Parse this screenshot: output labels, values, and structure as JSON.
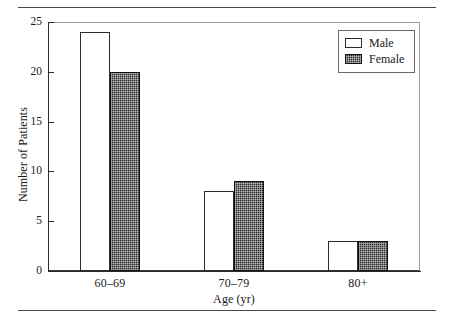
{
  "chart_data": {
    "type": "bar",
    "title": "",
    "xlabel": "Age (yr)",
    "ylabel": "Number of Patients",
    "categories": [
      "60–69",
      "70–79",
      "80+"
    ],
    "series": [
      {
        "name": "Male",
        "values": [
          24,
          8,
          3
        ]
      },
      {
        "name": "Female",
        "values": [
          20,
          9,
          3
        ]
      }
    ],
    "ylim": [
      0,
      25
    ],
    "yticks": [
      0,
      5,
      10,
      15,
      20,
      25
    ],
    "ytick_labels": [
      "0",
      "5",
      "10",
      "15",
      "20",
      "25"
    ],
    "grid": false,
    "legend_position": "top-right",
    "colors": {
      "male_fill": "#ffffff",
      "male_edge": "#2b2b2b",
      "female_fill": "#2a2a2a",
      "female_edge": "#111111",
      "axis": "#2b2b2b",
      "frame": "#9a9a9a",
      "rule": "#4a4a4a",
      "background": "#ffffff",
      "text": "#1a1a1a"
    }
  },
  "legend": {
    "entries": [
      {
        "label": "Male"
      },
      {
        "label": "Female"
      }
    ]
  },
  "axes": {
    "y_title": "Number of Patients",
    "x_title": "Age (yr)"
  }
}
